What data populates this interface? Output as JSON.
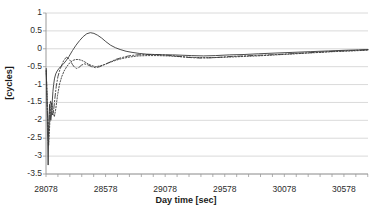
{
  "chart_data": {
    "type": "line",
    "title": "",
    "xlabel": "Day time [sec]",
    "ylabel": "[cycles]",
    "xlim": [
      28078,
      30780
    ],
    "ylim": [
      -3.5,
      1
    ],
    "xticks": [
      28078,
      28578,
      29078,
      29578,
      30078,
      30578
    ],
    "xtick_labels": [
      "28078",
      "28578",
      "29078",
      "29578",
      "30078",
      "30578"
    ],
    "yticks": [
      1,
      0.5,
      0,
      -0.5,
      -1,
      -1.5,
      -2,
      -2.5,
      -3,
      -3.5
    ],
    "ytick_labels": [
      "1",
      "0.5",
      "0",
      "-0.5",
      "-1",
      "-1.5",
      "-2",
      "-2.5",
      "-3",
      "-3.5"
    ],
    "grid": "horizontal",
    "legend": "none",
    "line_color": "#3a3a3a",
    "grid_color": "#d0d0d0",
    "axis_color": "#9a9a9a",
    "series": [
      {
        "name": "series-solid",
        "style": "solid",
        "x": [
          28080,
          28084,
          28088,
          28092,
          28096,
          28100,
          28104,
          28108,
          28112,
          28118,
          28124,
          28130,
          28136,
          28142,
          28150,
          28160,
          28172,
          28185,
          28200,
          28220,
          28245,
          28270,
          28300,
          28330,
          28360,
          28390,
          28420,
          28450,
          28480,
          28510,
          28545,
          28580,
          28620,
          28660,
          28700,
          28750,
          28800,
          28860,
          28920,
          28990,
          29060,
          29140,
          29220,
          29300,
          29400,
          29500,
          29620,
          29740,
          29860,
          30000,
          30150,
          30300,
          30450,
          30600,
          30700,
          30780
        ],
        "y": [
          -0.55,
          -1.15,
          -1.9,
          -2.6,
          -3.25,
          -2.55,
          -1.85,
          -1.55,
          -1.75,
          -2.0,
          -1.85,
          -1.5,
          -1.2,
          -1.0,
          -0.82,
          -0.7,
          -0.62,
          -0.56,
          -0.5,
          -0.44,
          -0.34,
          -0.22,
          -0.05,
          0.1,
          0.23,
          0.34,
          0.42,
          0.45,
          0.43,
          0.38,
          0.3,
          0.2,
          0.1,
          0.03,
          -0.02,
          -0.07,
          -0.1,
          -0.13,
          -0.15,
          -0.16,
          -0.17,
          -0.17,
          -0.18,
          -0.19,
          -0.2,
          -0.19,
          -0.17,
          -0.16,
          -0.14,
          -0.12,
          -0.1,
          -0.08,
          -0.06,
          -0.04,
          -0.03,
          -0.02
        ]
      },
      {
        "name": "series-dashdot",
        "style": "dashdot",
        "x": [
          28080,
          28086,
          28092,
          28098,
          28104,
          28110,
          28116,
          28124,
          28132,
          28142,
          28152,
          28164,
          28178,
          28195,
          28212,
          28230,
          28250,
          28268,
          28285,
          28300,
          28318,
          28336,
          28355,
          28375,
          28400,
          28430,
          28460,
          28495,
          28530,
          28570,
          28610,
          28660,
          28710,
          28770,
          28840,
          28910,
          28990,
          29070,
          29160,
          29260,
          29370,
          29480,
          29600,
          29730,
          29870,
          30020,
          30180,
          30340,
          30500,
          30650,
          30780
        ],
        "y": [
          -0.62,
          -1.3,
          -2.0,
          -2.45,
          -2.05,
          -1.6,
          -1.45,
          -1.62,
          -1.85,
          -1.72,
          -1.4,
          -1.05,
          -0.78,
          -0.58,
          -0.44,
          -0.3,
          -0.24,
          -0.27,
          -0.35,
          -0.44,
          -0.52,
          -0.55,
          -0.52,
          -0.46,
          -0.42,
          -0.45,
          -0.5,
          -0.53,
          -0.5,
          -0.44,
          -0.38,
          -0.3,
          -0.25,
          -0.2,
          -0.17,
          -0.16,
          -0.16,
          -0.17,
          -0.2,
          -0.24,
          -0.26,
          -0.25,
          -0.22,
          -0.2,
          -0.18,
          -0.16,
          -0.13,
          -0.1,
          -0.07,
          -0.05,
          -0.03
        ]
      },
      {
        "name": "series-dotted",
        "style": "dotted",
        "x": [
          28080,
          28086,
          28092,
          28100,
          28108,
          28116,
          28126,
          28136,
          28148,
          28160,
          28175,
          28192,
          28210,
          28230,
          28252,
          28275,
          28300,
          28325,
          28350,
          28375,
          28400,
          28430,
          28460,
          28495,
          28530,
          28570,
          28615,
          28665,
          28720,
          28780,
          28850,
          28930,
          29010,
          29100,
          29200,
          29310,
          29430,
          29560,
          29700,
          29850,
          30010,
          30170,
          30330,
          30490,
          30640,
          30780
        ],
        "y": [
          -0.6,
          -1.25,
          -1.95,
          -2.7,
          -2.2,
          -1.7,
          -1.5,
          -1.72,
          -1.9,
          -1.68,
          -1.3,
          -0.98,
          -0.78,
          -0.62,
          -0.5,
          -0.4,
          -0.33,
          -0.3,
          -0.3,
          -0.32,
          -0.36,
          -0.42,
          -0.47,
          -0.5,
          -0.48,
          -0.44,
          -0.38,
          -0.32,
          -0.27,
          -0.23,
          -0.2,
          -0.19,
          -0.19,
          -0.2,
          -0.22,
          -0.24,
          -0.25,
          -0.24,
          -0.22,
          -0.2,
          -0.17,
          -0.14,
          -0.11,
          -0.08,
          -0.06,
          -0.04
        ]
      }
    ]
  }
}
